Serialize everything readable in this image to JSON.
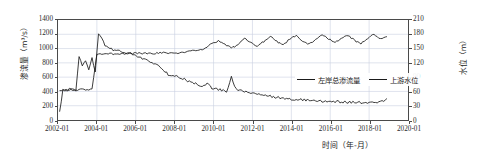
{
  "chart_data": {
    "type": "line",
    "title": "",
    "xlabel": "时间（年-月）",
    "ylabel": "渗流量（m³/s）",
    "ylabel_right": "水位（m）",
    "xlim": [
      "2002-01",
      "2020-01"
    ],
    "ylim": [
      0,
      1400
    ],
    "ylim_right": [
      0,
      210
    ],
    "grid": true,
    "legend_position": "inside-right-middle",
    "xticks": [
      "2002-01",
      "2004-01",
      "2006-01",
      "2008-01",
      "2010-01",
      "2012-01",
      "2014-01",
      "2016-01",
      "2018-01",
      "2020-01"
    ],
    "yticks_left": [
      0,
      200,
      400,
      600,
      800,
      1000,
      1200,
      1400
    ],
    "yticks_right": [
      0,
      30,
      60,
      90,
      120,
      150,
      180,
      210
    ],
    "series": [
      {
        "name": "左岸总渗流量",
        "axis": "left",
        "unit": "m³/s",
        "color": "#1a1a1a",
        "x": [
          "2002-02",
          "2002-04",
          "2002-06",
          "2002-08",
          "2002-10",
          "2002-12",
          "2003-02",
          "2003-04",
          "2003-06",
          "2003-08",
          "2003-10",
          "2003-12",
          "2004-02",
          "2004-04",
          "2004-06",
          "2004-08",
          "2004-10",
          "2004-12",
          "2005-03",
          "2005-06",
          "2005-09",
          "2005-12",
          "2006-03",
          "2006-06",
          "2006-09",
          "2006-12",
          "2007-03",
          "2007-06",
          "2007-09",
          "2007-12",
          "2008-03",
          "2008-06",
          "2008-09",
          "2008-12",
          "2009-03",
          "2009-06",
          "2009-09",
          "2009-12",
          "2010-03",
          "2010-06",
          "2010-09",
          "2010-12",
          "2011-03",
          "2011-06",
          "2011-09",
          "2011-12",
          "2012-03",
          "2012-06",
          "2012-09",
          "2012-12",
          "2013-03",
          "2013-06",
          "2013-09",
          "2013-12",
          "2014-03",
          "2014-06",
          "2014-09",
          "2014-12",
          "2015-03",
          "2015-06",
          "2015-09",
          "2015-12",
          "2016-03",
          "2016-06",
          "2016-09",
          "2016-12",
          "2017-03",
          "2017-06",
          "2017-09",
          "2017-12",
          "2018-03",
          "2018-06",
          "2018-09",
          "2018-12"
        ],
        "values": [
          110,
          420,
          400,
          440,
          430,
          420,
          880,
          760,
          820,
          700,
          860,
          690,
          1215,
          1130,
          1050,
          1015,
          990,
          975,
          965,
          945,
          925,
          930,
          880,
          845,
          830,
          790,
          770,
          700,
          640,
          620,
          600,
          580,
          545,
          530,
          500,
          470,
          520,
          450,
          430,
          420,
          400,
          600,
          430,
          410,
          395,
          380,
          370,
          360,
          340,
          330,
          320,
          310,
          300,
          295,
          290,
          285,
          280,
          278,
          272,
          268,
          265,
          262,
          258,
          255,
          252,
          250,
          248,
          246,
          244,
          242,
          240,
          245,
          255,
          290
        ]
      },
      {
        "name": "上游水位",
        "axis": "right",
        "unit": "m",
        "color": "#1a1a1a",
        "x": [
          "2002-02",
          "2002-06",
          "2002-10",
          "2003-02",
          "2003-06",
          "2003-10",
          "2004-01",
          "2004-04",
          "2004-08",
          "2004-12",
          "2005-04",
          "2005-08",
          "2005-12",
          "2006-04",
          "2006-08",
          "2006-12",
          "2007-04",
          "2007-08",
          "2007-12",
          "2008-04",
          "2008-08",
          "2008-12",
          "2009-04",
          "2009-08",
          "2009-12",
          "2010-04",
          "2010-08",
          "2010-12",
          "2011-04",
          "2011-08",
          "2011-12",
          "2012-04",
          "2012-08",
          "2012-12",
          "2013-04",
          "2013-08",
          "2013-12",
          "2014-04",
          "2014-08",
          "2014-12",
          "2015-04",
          "2015-08",
          "2015-12",
          "2016-04",
          "2016-08",
          "2016-12",
          "2017-04",
          "2017-08",
          "2017-12",
          "2018-04",
          "2018-08",
          "2018-12"
        ],
        "values": [
          62,
          63,
          63,
          64,
          64,
          64,
          139,
          139,
          139,
          139,
          139,
          140,
          140,
          140,
          140,
          140,
          141,
          141,
          141,
          141,
          143,
          145,
          147,
          150,
          161,
          166,
          158,
          152,
          157,
          172,
          162,
          155,
          165,
          177,
          165,
          158,
          170,
          178,
          166,
          159,
          168,
          180,
          170,
          162,
          172,
          178,
          167,
          160,
          172,
          180,
          170,
          174
        ]
      }
    ]
  },
  "axes": {
    "left_title": "渗流量（m³/s）",
    "right_title": "水位（m）",
    "x_title": "时间（年-月）",
    "x_ticks": [
      "2002-01",
      "2004-01",
      "2006-01",
      "2008-01",
      "2010-01",
      "2012-01",
      "2014-01",
      "2016-01",
      "2018-01",
      "2020-01"
    ],
    "y_ticks_left": [
      "1400",
      "1200",
      "1000",
      "800",
      "600",
      "400",
      "200",
      "0"
    ],
    "y_ticks_right": [
      "210",
      "180",
      "150",
      "120",
      "90",
      "60",
      "30",
      "0"
    ]
  },
  "legend": {
    "items": [
      {
        "label": "左岸总渗流量",
        "color": "#1a1a1a"
      },
      {
        "label": "上游水位",
        "color": "#1a1a1a"
      }
    ]
  },
  "colors": {
    "frame": "#4a4a4a",
    "grid": "#c9cfe0",
    "series": "#1a1a1a",
    "background": "#ffffff"
  }
}
